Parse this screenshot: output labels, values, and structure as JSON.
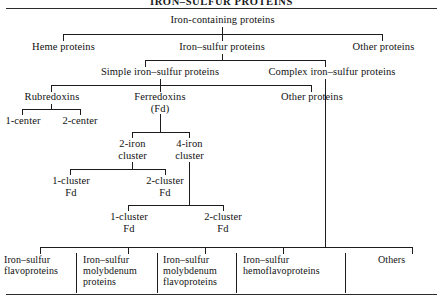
{
  "figure": {
    "title": "IRON–SULFUR PROTEINS",
    "root": "Iron-containing proteins"
  },
  "level2": {
    "heme": "Heme proteins",
    "iron_sulfur": "Iron–sulfur proteins",
    "other": "Other proteins"
  },
  "level3": {
    "simple": "Simple iron–sulfur proteins",
    "complex": "Complex iron–sulfur proteins"
  },
  "level4": {
    "rubredoxins": "Rubredoxins",
    "ferredoxins": "Ferredoxins\n(Fd)",
    "other_proteins": "Other proteins"
  },
  "rubredoxin_children": {
    "one_center": "1-center",
    "two_center": "2-center"
  },
  "ferredoxin_children": {
    "two_iron": "2-iron\ncluster",
    "four_iron": "4-iron\ncluster"
  },
  "two_iron_children": {
    "one_cluster": "1-cluster\nFd",
    "two_cluster": "2-cluster\nFd"
  },
  "four_iron_children": {
    "one_cluster": "1-cluster\nFd",
    "two_cluster": "2-cluster\nFd"
  },
  "complex_children": [
    {
      "label": "Iron–sulfur\nflavoproteins"
    },
    {
      "label": "Iron–sulfur\nmolybdenum\nproteins"
    },
    {
      "label": "Iron–sulfur\nmolybdenum\nflavoproteins"
    },
    {
      "label": "Iron–sulfur\nhemoflavoproteins"
    },
    {
      "label": "Others"
    }
  ],
  "colors": {
    "ink": "#111111",
    "line": "#1c1c1c",
    "rule": "#2b2b2b",
    "background": "#ffffff"
  }
}
